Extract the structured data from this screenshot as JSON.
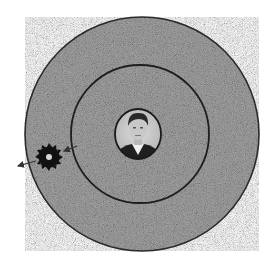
{
  "diagram": {
    "type": "concentric-circles",
    "colors": {
      "background": "#ffffff",
      "ring_fill": "#9a9a9a",
      "ring_stroke": "#2a2a2a",
      "saw_blade": "#111111",
      "arrow": "#333333"
    },
    "outer_ring": {
      "cx": 142,
      "cy": 134,
      "r": 117
    },
    "inner_ring": {
      "cx": 140,
      "cy": 134,
      "r": 69
    },
    "center_portrait": {
      "cx": 138,
      "cy": 134,
      "rx": 23,
      "ry": 25,
      "subject": "portrait of a young man in suit"
    },
    "saw_blade": {
      "cx": 49,
      "cy": 157,
      "r": 13,
      "teeth": 12,
      "hole_r": 3
    },
    "arrows": [
      {
        "name": "arrow-toward-blade",
        "from": [
          77,
          146
        ],
        "to": [
          63,
          151
        ]
      },
      {
        "name": "arrow-outward",
        "from": [
          36,
          161
        ],
        "to": [
          17,
          166
        ]
      }
    ],
    "labels": {
      "title": "Concentric ring diagram with central portrait and saw blade"
    }
  }
}
